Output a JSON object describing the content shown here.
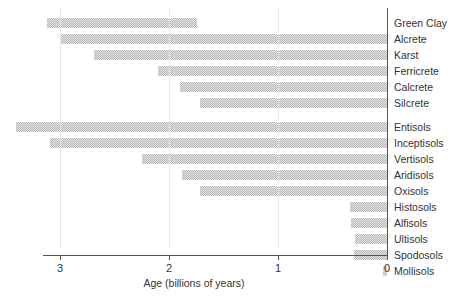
{
  "chart_data": {
    "type": "bar",
    "orientation": "horizontal",
    "title": "",
    "xlabel": "Age (billions of years)",
    "ylabel": "",
    "xlim": [
      3.6,
      0
    ],
    "x_axis_reversed": true,
    "xticks": [
      3,
      2,
      1,
      0
    ],
    "xtick_labels": [
      "3",
      "2",
      "1",
      "0"
    ],
    "grid": "vertical-only",
    "legend": "none",
    "units": "billions of years",
    "note": "Each bar is a floating range spanning from the oldest known occurrence (start) to the present-day end (stop).",
    "groups": [
      {
        "name": "",
        "categories": [
          {
            "label": "Green Clay",
            "start": 3.12,
            "stop": 1.74
          },
          {
            "label": "Alcrete",
            "start": 3.0,
            "stop": 0.0
          },
          {
            "label": "Karst",
            "start": 2.69,
            "stop": 0.0
          },
          {
            "label": "Ferricrete",
            "start": 2.1,
            "stop": 0.0
          },
          {
            "label": "Calcrete",
            "start": 1.9,
            "stop": 0.0
          },
          {
            "label": "Silcrete",
            "start": 1.72,
            "stop": 0.0
          }
        ]
      },
      {
        "name": "",
        "categories": [
          {
            "label": "Entisols",
            "start": 3.4,
            "stop": 0.0
          },
          {
            "label": "Inceptisols",
            "start": 3.09,
            "stop": 0.0
          },
          {
            "label": "Vertisols",
            "start": 2.25,
            "stop": 0.0
          },
          {
            "label": "Aridisols",
            "start": 1.88,
            "stop": 0.0
          },
          {
            "label": "Oxisols",
            "start": 1.72,
            "stop": 0.0
          },
          {
            "label": "Histosols",
            "start": 0.34,
            "stop": 0.0
          },
          {
            "label": "Alfisols",
            "start": 0.33,
            "stop": 0.0
          },
          {
            "label": "Ultisols",
            "start": 0.29,
            "stop": 0.0
          },
          {
            "label": "Spodosols",
            "start": 0.3,
            "stop": 0.0
          },
          {
            "label": "Mollisols",
            "start": 0.04,
            "stop": 0.0
          }
        ]
      }
    ],
    "colors": {
      "bar_fill": "#b3b3b3",
      "bar_pattern": "#ffffff",
      "axis": "#555555",
      "grid": "#e8e8e8",
      "text": "#333333",
      "background": "#ffffff"
    }
  },
  "axis": {
    "title": "Age (billions of years)",
    "ticks": [
      {
        "label": "3",
        "value": 3
      },
      {
        "label": "2",
        "value": 2
      },
      {
        "label": "1",
        "value": 1
      },
      {
        "label": "0",
        "value": 0
      }
    ]
  }
}
